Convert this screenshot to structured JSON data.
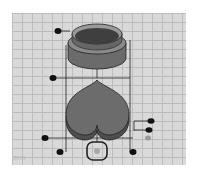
{
  "viewport": {
    "type": "3d-workplane",
    "grid_color": "#bdbdbd",
    "plane_color": "#d9d9d9",
    "scale_label": "mm"
  },
  "objects": [
    {
      "name": "cylinder",
      "shape": "cylinder",
      "color": "#555555",
      "selected": true
    },
    {
      "name": "heart",
      "shape": "heart",
      "color": "#6a6a6a",
      "selected": true
    }
  ],
  "handles": {
    "color": "#111111",
    "inactive_color": "#9a9a9a",
    "items": [
      {
        "name": "top-height-handle",
        "x": 58,
        "y": 31
      },
      {
        "name": "mid-height-handle",
        "x": 53,
        "y": 78
      },
      {
        "name": "left-corner-handle",
        "x": 45,
        "y": 138
      },
      {
        "name": "bottom-left-handle",
        "x": 60,
        "y": 152
      },
      {
        "name": "bottom-right-handle",
        "x": 133,
        "y": 152
      },
      {
        "name": "right-handle-1",
        "x": 151,
        "y": 121
      },
      {
        "name": "right-handle-2",
        "x": 149,
        "y": 130
      }
    ]
  },
  "rotate_handle": {
    "x": 97,
    "y": 150
  }
}
